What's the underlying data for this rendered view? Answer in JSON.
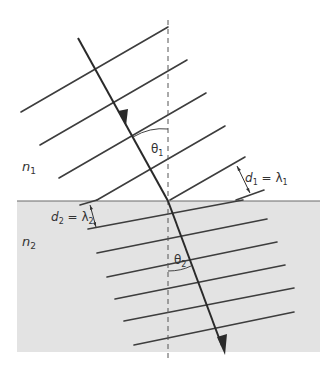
{
  "diagram": {
    "colors": {
      "background": "#ffffff",
      "medium2_fill": "#e3e3e3",
      "interface_line": "#6a6a6a",
      "wavefront": "#3d3d3d",
      "ray": "#2a2a2a",
      "normal": "#555555",
      "text": "#333333"
    },
    "labels": {
      "medium1": "n",
      "medium1_sub": "1",
      "medium2": "n",
      "medium2_sub": "2",
      "theta1": "θ",
      "theta1_sub": "1",
      "theta2": "θ",
      "theta2_sub": "2",
      "d1_lhs": "d",
      "d1_lhs_sub": "1",
      "d1_eq": " = λ",
      "d1_rhs_sub": "1",
      "d2_lhs": "d",
      "d2_lhs_sub": "2",
      "d2_eq": " = λ",
      "d2_rhs_sub": "2"
    },
    "elements": {
      "interface_y": 201,
      "normal_x": 168,
      "incident_ray": {
        "x1": 78,
        "y1": 38,
        "x2": 168,
        "y2": 201
      },
      "refracted_ray": {
        "x1": 168,
        "y1": 201,
        "x2": 224,
        "y2": 352
      },
      "upper_wavefront_count": 6,
      "lower_wavefront_count": 7
    }
  }
}
